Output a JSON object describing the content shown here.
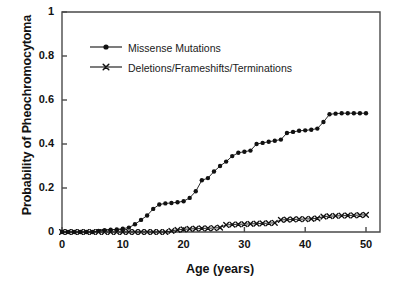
{
  "chart_data": {
    "type": "line",
    "title": "",
    "xlabel": "Age (years)",
    "ylabel": "Probability of Pheochromocytoma",
    "xlim": [
      0,
      52
    ],
    "ylim": [
      0,
      1
    ],
    "xticks": [
      0,
      10,
      20,
      30,
      40,
      50
    ],
    "xtick_labels": [
      "0",
      "10",
      "20",
      "30",
      "40",
      "50"
    ],
    "yticks": [
      0,
      0.2,
      0.4,
      0.6,
      0.8,
      1
    ],
    "ytick_labels": [
      "0",
      "0.2",
      "0.4",
      "0.6",
      "0.8",
      "1"
    ],
    "grid": false,
    "legend_position": "upper-left-inside",
    "series": [
      {
        "name": "Missense Mutations",
        "marker": "filled-circle",
        "color": "#111111",
        "x": [
          0,
          1,
          2,
          3,
          4,
          5,
          6,
          7,
          8,
          9,
          10,
          11,
          12,
          13,
          14,
          15,
          16,
          17,
          18,
          19,
          20,
          21,
          22,
          23,
          24,
          25,
          26,
          27,
          28,
          29,
          30,
          31,
          32,
          33,
          34,
          35,
          36,
          37,
          38,
          39,
          40,
          41,
          42,
          43,
          44,
          45,
          46,
          47,
          48,
          49,
          50
        ],
        "y": [
          0,
          0,
          0,
          0,
          0,
          0,
          0.005,
          0.008,
          0.01,
          0.012,
          0.015,
          0.02,
          0.035,
          0.055,
          0.075,
          0.105,
          0.125,
          0.13,
          0.132,
          0.135,
          0.14,
          0.155,
          0.185,
          0.235,
          0.245,
          0.275,
          0.3,
          0.32,
          0.345,
          0.36,
          0.365,
          0.37,
          0.4,
          0.405,
          0.41,
          0.415,
          0.42,
          0.45,
          0.455,
          0.46,
          0.462,
          0.465,
          0.47,
          0.5,
          0.535,
          0.538,
          0.54,
          0.54,
          0.54,
          0.54,
          0.54
        ]
      },
      {
        "name": "Deletions/Frameshifts/Terminations",
        "marker": "x-cross",
        "color": "#111111",
        "x": [
          0,
          1,
          2,
          3,
          4,
          5,
          6,
          7,
          8,
          9,
          10,
          11,
          12,
          13,
          14,
          15,
          16,
          17,
          18,
          19,
          20,
          21,
          22,
          23,
          24,
          25,
          26,
          27,
          28,
          29,
          30,
          31,
          32,
          33,
          34,
          35,
          36,
          37,
          38,
          39,
          40,
          41,
          42,
          43,
          44,
          45,
          46,
          47,
          48,
          49,
          50
        ],
        "y": [
          0,
          0,
          0,
          0,
          0,
          0,
          0,
          0,
          0,
          0,
          0,
          0,
          0,
          0,
          0,
          0,
          0,
          0,
          0.005,
          0.01,
          0.012,
          0.014,
          0.015,
          0.016,
          0.017,
          0.018,
          0.02,
          0.032,
          0.034,
          0.035,
          0.036,
          0.037,
          0.038,
          0.039,
          0.04,
          0.042,
          0.055,
          0.056,
          0.057,
          0.058,
          0.059,
          0.06,
          0.062,
          0.07,
          0.072,
          0.073,
          0.074,
          0.075,
          0.076,
          0.077,
          0.078
        ]
      }
    ]
  },
  "legend": {
    "entries": [
      {
        "label": "Missense Mutations"
      },
      {
        "label": "Deletions/Frameshifts/Terminations"
      }
    ]
  },
  "axes": {
    "y_title": "Probability of Pheochromocytoma",
    "x_title": "Age (years)"
  }
}
